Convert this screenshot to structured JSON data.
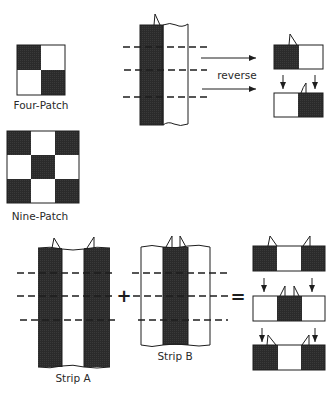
{
  "colors": {
    "dark": "#2b2b2b",
    "light": "#ffffff",
    "line": "#1e1e1e"
  },
  "labels": {
    "four_patch": "Four-Patch",
    "nine_patch": "Nine-Patch",
    "reverse": "reverse",
    "strip_a": "Strip A",
    "strip_b": "Strip B",
    "plus": "+",
    "equals": "="
  },
  "four_patch": {
    "grid": [
      [
        "dark",
        "light"
      ],
      [
        "light",
        "dark"
      ]
    ]
  },
  "nine_patch": {
    "grid": [
      [
        "dark",
        "light",
        "dark"
      ],
      [
        "light",
        "dark",
        "light"
      ],
      [
        "dark",
        "light",
        "dark"
      ]
    ]
  },
  "two_strip_set": {
    "columns": [
      "dark",
      "light"
    ],
    "cut_lines": 3
  },
  "reversed_pairs": [
    [
      "dark",
      "light"
    ],
    [
      "light",
      "dark"
    ]
  ],
  "strip_a": {
    "columns": [
      "dark",
      "light",
      "dark"
    ],
    "cut_lines": 3
  },
  "strip_b": {
    "columns": [
      "light",
      "dark",
      "light"
    ],
    "cut_lines": 3
  },
  "nine_patch_rows": [
    [
      "dark",
      "light",
      "dark"
    ],
    [
      "light",
      "dark",
      "light"
    ],
    [
      "dark",
      "light",
      "dark"
    ]
  ]
}
